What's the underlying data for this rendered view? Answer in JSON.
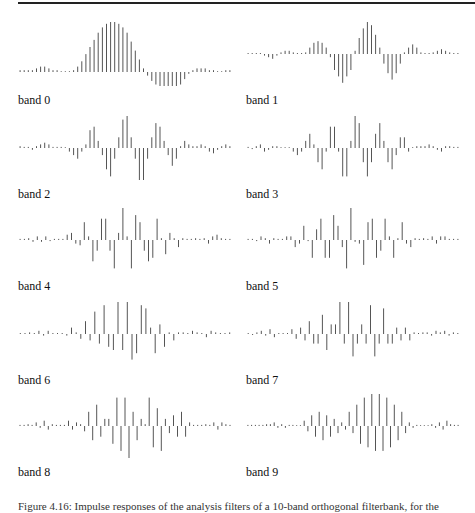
{
  "figure": {
    "caption": "Figure 4.16: Impulse responses of the analysis filters of a 10-band orthogonal filterbank, for the",
    "stem_color": "#555555",
    "panels": [
      {
        "label": "band 0",
        "col": 0,
        "row": 0
      },
      {
        "label": "band 1",
        "col": 1,
        "row": 0
      },
      {
        "label": "band 2",
        "col": 0,
        "row": 1
      },
      {
        "label": "band 3",
        "col": 1,
        "row": 1
      },
      {
        "label": "band 4",
        "col": 0,
        "row": 2
      },
      {
        "label": "band 5",
        "col": 1,
        "row": 2
      },
      {
        "label": "band 6",
        "col": 0,
        "row": 3
      },
      {
        "label": "band 7",
        "col": 1,
        "row": 3
      },
      {
        "label": "band 8",
        "col": 0,
        "row": 4
      },
      {
        "label": "band 9",
        "col": 1,
        "row": 4
      }
    ]
  },
  "chart_data": [
    {
      "type": "bar",
      "title": "band 0",
      "values": [
        0.5,
        0.5,
        0.5,
        0.5,
        1,
        1.5,
        1.5,
        1,
        0.5,
        0.5,
        0,
        0,
        0,
        0.5,
        1.5,
        3,
        5,
        7,
        9,
        11,
        12.5,
        13.5,
        14,
        14,
        13.5,
        12.5,
        11,
        8.5,
        6,
        3.5,
        1,
        -1,
        -2.5,
        -3.5,
        -4.5,
        -5,
        -5,
        -5,
        -4.5,
        -3.5,
        -2,
        -0.5,
        0.5,
        1,
        1,
        1,
        0.5,
        0.5,
        0,
        0,
        0.5,
        0.5
      ]
    },
    {
      "type": "bar",
      "title": "band 1",
      "values": [
        0.3,
        0.3,
        0.3,
        0.3,
        -0.5,
        -1,
        -1.5,
        -0.5,
        0.5,
        1,
        1,
        0.5,
        0.3,
        0.3,
        0.5,
        2,
        3.5,
        4,
        3.5,
        2,
        -1,
        -5,
        -7,
        -9,
        -7,
        -5,
        1,
        5,
        8,
        10,
        9,
        6,
        2,
        -3,
        -6,
        -8,
        -6,
        -3,
        0.5,
        2,
        3,
        2,
        0.5,
        0.3,
        0.3,
        0.5,
        1,
        1.5,
        1,
        0.5,
        0.3,
        0.3
      ]
    },
    {
      "type": "bar",
      "title": "band 2",
      "values": [
        0.5,
        0.3,
        0.3,
        -0.5,
        0.5,
        1,
        1.5,
        1,
        0.3,
        0.3,
        0.3,
        0,
        -1,
        -2,
        -3,
        -1,
        1,
        5,
        6,
        2,
        -2,
        -6,
        -8,
        -3,
        3,
        8,
        9,
        3,
        -3,
        -9,
        -9,
        -3,
        3,
        7,
        6,
        2,
        -2,
        -5,
        -3,
        0.5,
        2,
        1,
        0.5,
        0.5,
        1,
        0.5,
        -1,
        -1.5,
        -0.5,
        0.5,
        1,
        0.5
      ]
    },
    {
      "type": "bar",
      "title": "band 3",
      "values": [
        0.3,
        -0.3,
        0.5,
        1,
        -1,
        -0.5,
        0.5,
        0.5,
        0,
        0,
        0,
        -1,
        -2,
        -1,
        2,
        4,
        1,
        -4,
        -6,
        -1,
        6,
        6,
        -1,
        -8,
        -8,
        2,
        9,
        7,
        -4,
        -8,
        -4,
        4,
        7,
        2,
        -4,
        -6,
        -2,
        3,
        3,
        -1,
        0,
        0.5,
        0.5,
        0.5,
        1,
        0.5,
        -0.5,
        -1,
        0.5,
        0.5,
        0.3,
        0.3
      ]
    },
    {
      "type": "bar",
      "title": "band 5",
      "values": [
        0.3,
        0.3,
        -0.3,
        1,
        0.5,
        -1,
        0.5,
        0.3,
        0.3,
        1,
        1,
        -2,
        -1,
        4,
        -0.3,
        -5,
        3,
        6,
        -5,
        -5,
        7,
        4,
        -2,
        -8,
        9,
        -0.5,
        -1,
        -7,
        5,
        6,
        -5,
        -3,
        6,
        1,
        -5,
        0.5,
        5,
        -1,
        -2,
        0.5,
        0.3,
        0.5,
        0.3,
        1,
        -1,
        1,
        1,
        0.3,
        0.3,
        0.3
      ]
    },
    {
      "type": "bar",
      "title": "band 4",
      "values": [
        0.3,
        0.3,
        0.5,
        -0.5,
        1,
        -0.5,
        1,
        -0.3,
        0.3,
        0.3,
        0.3,
        1.5,
        2,
        -1,
        -1.5,
        5,
        1,
        -6,
        -3,
        6,
        6,
        -3,
        -8,
        2,
        9,
        1,
        -8,
        7,
        5,
        -3,
        -6,
        -5,
        6,
        0.5,
        -4,
        2,
        0.5,
        -2,
        0.5,
        0.3,
        0.3,
        0.5,
        0.3,
        0.5,
        -1,
        1,
        1.5,
        0.5,
        0.3,
        0.3
      ]
    },
    {
      "type": "bar",
      "title": "band 6",
      "values": [
        0.3,
        0.3,
        0.5,
        0.3,
        1,
        -0.5,
        1,
        0.3,
        0.3,
        0.3,
        -0.5,
        2,
        0.5,
        -1.5,
        4,
        -2,
        7,
        -3,
        9,
        -4,
        -5,
        10,
        -5,
        10,
        -8,
        -6,
        9,
        8,
        2,
        -6,
        3,
        -4,
        0.5,
        -2,
        0.5,
        0.5,
        0.3,
        1,
        0.5,
        0.3,
        -1,
        1,
        0.5,
        0.3,
        0.3,
        0.5
      ]
    },
    {
      "type": "bar",
      "title": "band 7",
      "values": [
        0.3,
        -0.3,
        0.5,
        1,
        -0.5,
        1.5,
        -1,
        0.3,
        0.3,
        0.3,
        1.5,
        -1.5,
        2,
        -2,
        4,
        -3,
        -3,
        6,
        -5,
        3,
        3,
        10,
        -3,
        10,
        -7,
        -3,
        3,
        -3,
        9,
        -7,
        -3,
        8,
        -3,
        -3,
        2,
        -2,
        2,
        -2,
        0.5,
        0.3,
        0.5,
        0.5,
        -0.5,
        1,
        0.5,
        1,
        -0.5,
        0.5,
        0.3
      ]
    },
    {
      "type": "bar",
      "title": "band 8",
      "values": [
        0.3,
        0.3,
        0.5,
        0.3,
        1,
        -0.5,
        1.5,
        -1,
        0.5,
        0.3,
        0.3,
        0.3,
        1.5,
        -1,
        1,
        0.5,
        -1.5,
        4,
        -4,
        6,
        -3,
        2,
        2,
        -5,
        8,
        -7,
        8,
        -9,
        4,
        -4,
        2,
        0.5,
        8,
        -6,
        5,
        -7,
        2,
        -2,
        3,
        -3,
        4,
        -3,
        1,
        0.3,
        0.3,
        0.3,
        0.5,
        0.3,
        1,
        -1,
        1,
        0.5,
        0.3
      ]
    },
    {
      "type": "bar",
      "title": "band 9",
      "values": [
        0.3,
        0.3,
        0.3,
        0.3,
        0.3,
        0.5,
        0.5,
        1,
        -0.5,
        0.5,
        -0.5,
        0.3,
        0.3,
        0,
        0,
        1.5,
        -1.5,
        3,
        -3,
        4,
        -4,
        3,
        -3,
        2,
        -2,
        1,
        -1,
        4,
        -2,
        6,
        -5,
        8,
        -6,
        9,
        -7,
        9,
        -7,
        8,
        -6,
        6,
        -4,
        4,
        -2,
        1,
        -0.5,
        0.3,
        0,
        0,
        0,
        0.5,
        -0.5,
        1,
        -1,
        1.5,
        0.5,
        0.3,
        0.3
      ]
    }
  ]
}
